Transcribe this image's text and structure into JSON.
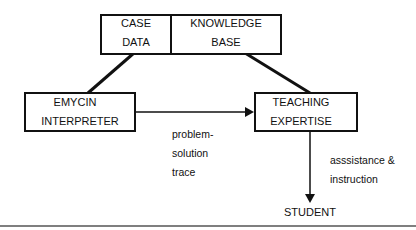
{
  "diagram": {
    "nodes": {
      "case_data": {
        "line1": "CASE",
        "line2": "DATA"
      },
      "knowledge_base": {
        "line1": "KNOWLEDGE",
        "line2": "BASE"
      },
      "emycin": {
        "line1": "EMYCIN",
        "line2": "INTERPRETER"
      },
      "teaching": {
        "line1": "TEACHING",
        "line2": "EXPERTISE"
      },
      "student": {
        "label": "STUDENT"
      }
    },
    "edges": {
      "emycin_to_teaching": {
        "line1": "problem-",
        "line2": "solution",
        "line3": "trace"
      },
      "teaching_to_student": {
        "line1": "asssistance &",
        "line2": "instruction"
      }
    },
    "colors": {
      "stroke": "#111111",
      "background": "#ffffff",
      "rule": "#555555"
    }
  }
}
